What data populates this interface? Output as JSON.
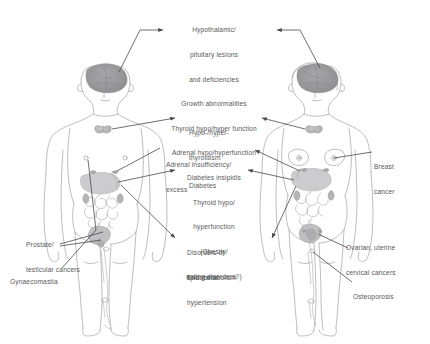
{
  "figure": {
    "background_color": "#ffffff",
    "text_color": "#58585a",
    "line_color": "#6e6e70",
    "body_outline_color": "#9a9a9c",
    "organ_shade_color": "#b9b9bb",
    "brain_shade_color": "#9e9ea0"
  },
  "bodies": {
    "left": {
      "name": "male-figure",
      "label": "male body"
    },
    "right": {
      "name": "female-figure",
      "label": "female body"
    }
  },
  "center_labels": {
    "top_block": {
      "lines": [
        "Hypothalamic/",
        "pituitary lesions",
        "and deficiencies",
        "Growth abnormalities",
        "Thyroid hypo/hyper function",
        "Adrenal hypo/hyperfunction",
        "Diabetes insipidis",
        "Thyroid hypo/",
        "hyperfunction",
        "(Obesity/",
        "eating disorders?)"
      ]
    },
    "thyroid": {
      "lines": [
        "Hypo-/hyper-",
        "thyroidism"
      ]
    },
    "adrenal": {
      "lines": [
        "Adrenal insufficiency/",
        "excess"
      ]
    },
    "diabetes": {
      "lines": [
        "Diabetes"
      ]
    },
    "lipid": {
      "lines": [
        "Disorders of",
        "lipid metabolism"
      ]
    },
    "hypertension": {
      "lines": [
        "Endocrine",
        "hypertension"
      ]
    }
  },
  "left_labels": {
    "prostate": {
      "lines": [
        "Prostate/",
        "testicular cancers"
      ]
    },
    "gynaecomastia": {
      "lines": [
        "Gynaecomastia"
      ]
    }
  },
  "right_labels": {
    "breast": {
      "lines": [
        "Breast",
        "cancer"
      ]
    },
    "ovarian": {
      "lines": [
        "Ovarian, uterine",
        "cervical cancers"
      ]
    },
    "osteoporosis": {
      "lines": [
        "Osteoporosis"
      ]
    }
  }
}
